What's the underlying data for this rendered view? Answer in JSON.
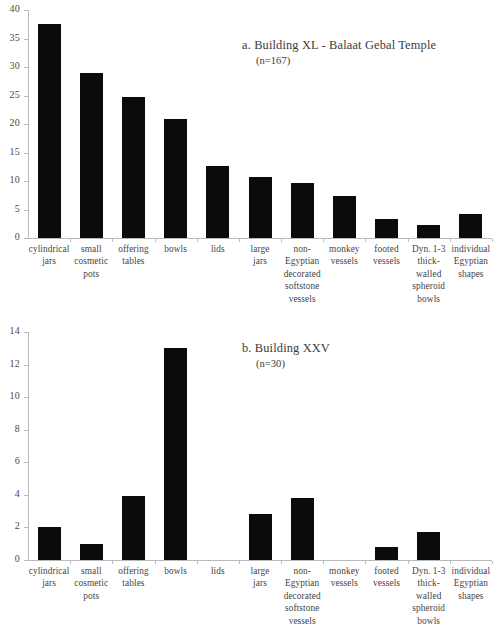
{
  "figure": {
    "panels": [
      "a",
      "b"
    ]
  },
  "chart_data": [
    {
      "type": "bar",
      "panel_label": "a",
      "title": "a. Building XL - Balaat Gebal Temple",
      "subtitle": "(n=167)",
      "n": 167,
      "xlabel": "",
      "ylabel": "",
      "ylim": [
        0,
        40
      ],
      "ytick_step": 5,
      "yticks": [
        "40",
        "35",
        "30",
        "25",
        "20",
        "15",
        "10",
        "5",
        "0"
      ],
      "ytick_values": [
        40,
        35,
        30,
        25,
        20,
        15,
        10,
        5,
        0
      ],
      "grid": false,
      "legend": "none",
      "bar_color": "#0b0b0b",
      "axis_color": "#b9b9b9",
      "categories": [
        "cylindrical jars",
        "small cosmetic pots",
        "offering tables",
        "bowls",
        "lids",
        "large jars",
        "non-Egyptian decorated softstone vessels",
        "monkey vessels",
        "footed vessels",
        "Dyn. 1-3 thick-walled spheroid bowls",
        "individual Egyptian shapes"
      ],
      "category_lines": [
        [
          "cylindrical",
          "jars"
        ],
        [
          "small",
          "cosmetic",
          "pots"
        ],
        [
          "offering",
          "tables"
        ],
        [
          "bowls"
        ],
        [
          "lids"
        ],
        [
          "large",
          "jars"
        ],
        [
          "non-",
          "Egyptian",
          "decorated",
          "softstone",
          "vessels"
        ],
        [
          "monkey",
          "vessels"
        ],
        [
          "footed",
          "vessels"
        ],
        [
          "Dyn. 1-3",
          "thick-",
          "walled",
          "spheroid",
          "bowls"
        ],
        [
          "individual",
          "Egyptian",
          "shapes"
        ]
      ],
      "values": [
        37.5,
        29,
        24.8,
        20.8,
        12.7,
        10.7,
        9.6,
        7.3,
        3.4,
        2.2,
        4.2
      ]
    },
    {
      "type": "bar",
      "panel_label": "b",
      "title": "b. Building XXV",
      "subtitle": "(n=30)",
      "n": 30,
      "xlabel": "",
      "ylabel": "",
      "ylim": [
        0,
        14
      ],
      "ytick_step": 2,
      "yticks": [
        "14",
        "12",
        "10",
        "8",
        "6",
        "4",
        "2",
        "0"
      ],
      "ytick_values": [
        14,
        12,
        10,
        8,
        6,
        4,
        2,
        0
      ],
      "grid": false,
      "legend": "none",
      "bar_color": "#0b0b0b",
      "axis_color": "#b9b9b9",
      "categories": [
        "cylindrical jars",
        "small cosmetic pots",
        "offering tables",
        "bowls",
        "lids",
        "large jars",
        "non-Egyptian decorated softstone vessels",
        "monkey vessels",
        "footed vessels",
        "Dyn. 1-3 thick-walled spheroid bowls",
        "individual Egyptian shapes"
      ],
      "category_lines": [
        [
          "cylindrical",
          "jars"
        ],
        [
          "small",
          "cosmetic",
          "pots"
        ],
        [
          "offering",
          "tables"
        ],
        [
          "bowls"
        ],
        [
          "lids"
        ],
        [
          "large",
          "jars"
        ],
        [
          "non-",
          "Egyptian",
          "decorated",
          "softstone",
          "vessels"
        ],
        [
          "monkey",
          "vessels"
        ],
        [
          "footed",
          "vessels"
        ],
        [
          "Dyn. 1-3",
          "thick-",
          "walled",
          "spheroid",
          "bowls"
        ],
        [
          "individual",
          "Egyptian",
          "shapes"
        ]
      ],
      "values": [
        2,
        1,
        3.9,
        13,
        0,
        2.8,
        3.8,
        0,
        0.8,
        1.7,
        0
      ]
    }
  ]
}
